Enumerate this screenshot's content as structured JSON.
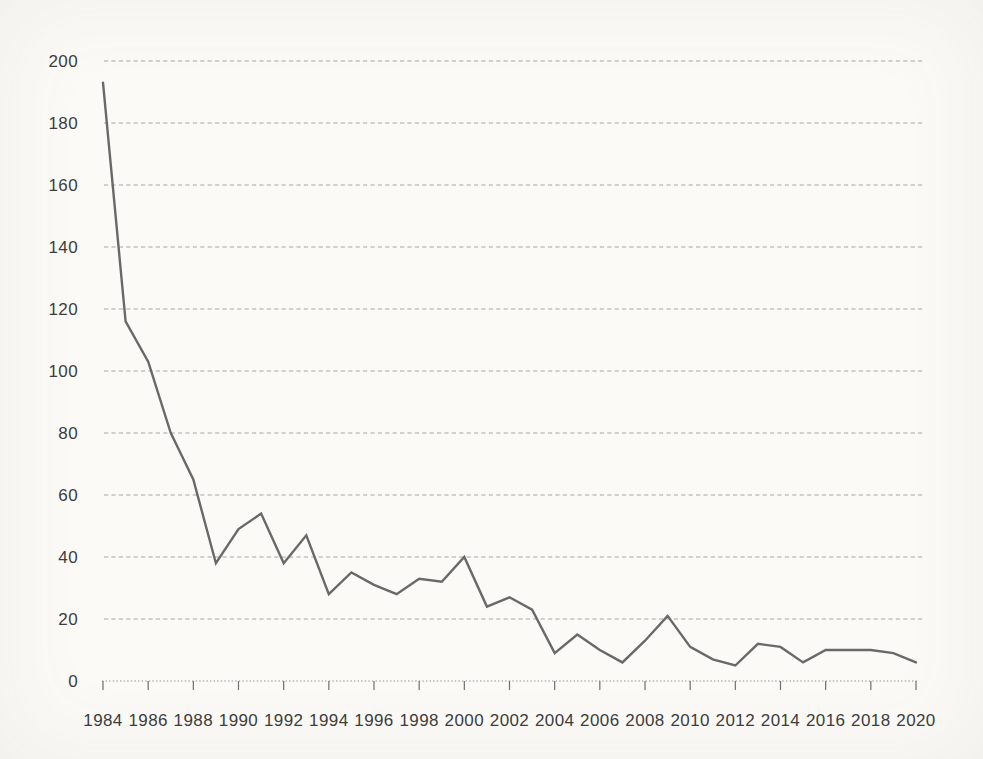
{
  "colors": {
    "background": "#fbfaf7",
    "line": "#696969",
    "grid": "#a6a6a6",
    "axis": "#8f8f8f",
    "text": "#3d3d3d"
  },
  "chart_data": {
    "type": "line",
    "title": "",
    "xlabel": "",
    "ylabel": "",
    "x": [
      1984,
      1985,
      1986,
      1987,
      1988,
      1989,
      1990,
      1991,
      1992,
      1993,
      1994,
      1995,
      1996,
      1997,
      1998,
      1999,
      2000,
      2001,
      2002,
      2003,
      2004,
      2005,
      2006,
      2007,
      2008,
      2009,
      2010,
      2011,
      2012,
      2013,
      2014,
      2015,
      2016,
      2017,
      2018,
      2019,
      2020
    ],
    "values": [
      193,
      116,
      103,
      80,
      65,
      38,
      49,
      54,
      38,
      47,
      28,
      35,
      31,
      28,
      33,
      32,
      40,
      24,
      27,
      23,
      9,
      15,
      10,
      6,
      13,
      21,
      11,
      7,
      5,
      12,
      11,
      6,
      10,
      10,
      10,
      9,
      6
    ],
    "ylim": [
      0,
      200
    ],
    "ytick_step": 20,
    "y_tick_labels": [
      "0",
      "20",
      "40",
      "60",
      "80",
      "100",
      "120",
      "140",
      "160",
      "180",
      "200"
    ],
    "xtick_step": 2,
    "x_tick_labels": [
      "1984",
      "1986",
      "1988",
      "1990",
      "1992",
      "1994",
      "1996",
      "1998",
      "2000",
      "2002",
      "2004",
      "2006",
      "2008",
      "2010",
      "2012",
      "2014",
      "2016",
      "2018",
      "2020"
    ],
    "grid": "horizontal-dashed",
    "legend": "none"
  }
}
